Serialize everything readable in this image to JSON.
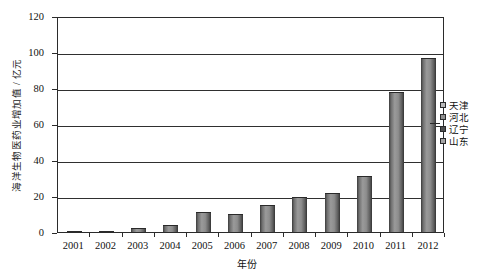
{
  "chart_data": {
    "type": "bar",
    "title": "",
    "xlabel": "年份",
    "ylabel": "海洋生物医药业增加值 / 亿元",
    "categories": [
      "2001",
      "2002",
      "2003",
      "2004",
      "2005",
      "2006",
      "2007",
      "2008",
      "2009",
      "2010",
      "2011",
      "2012"
    ],
    "series": [
      {
        "name": "山东",
        "values": [
          0.3,
          0.5,
          2.5,
          4.0,
          11.0,
          10.0,
          15.0,
          19.5,
          21.5,
          31.0,
          78.0,
          96.5
        ]
      }
    ],
    "legend_entries": [
      "天津",
      "河北",
      "辽宁",
      "山东"
    ],
    "legend_position": "right",
    "ylim": [
      0,
      120
    ],
    "yticks": [
      0,
      20,
      40,
      60,
      80,
      100,
      120
    ],
    "ytick_labels": [
      "0",
      "20",
      "40",
      "60",
      "80",
      "100",
      "120"
    ],
    "grid": true,
    "grid_axis": "y",
    "bar_color": "#8d8d8d",
    "bar_edge_color": "#2a2a2a",
    "axis_color": "#2b2b2b",
    "background_color": "#ffffff"
  }
}
